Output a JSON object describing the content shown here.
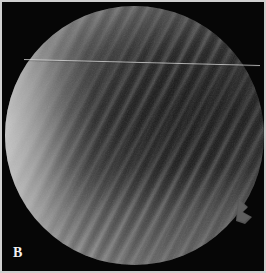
{
  "figure": {
    "panel_label": "B",
    "caption_alt": "Circular specimen micrograph with diagonal interference fringes",
    "background_color": "#060606",
    "frame_color": "#cfcfcf",
    "label_color": "#f2f2f2"
  },
  "specimen": {
    "name": "circular-specimen-disc",
    "shape": "circle",
    "center_x": 132,
    "center_y": 133,
    "radius": 130,
    "bright_limb_side": "left",
    "bright_limb_color": "#dadada",
    "dark_region_color": "#3e3e3e",
    "mid_region_color": "#787878"
  },
  "fringes": {
    "name": "interference-fringe-pattern",
    "orientation_degrees": 118,
    "spacing_px": 13,
    "contrast": "high-center-right",
    "light_band_color": "#9a9a9a",
    "dark_band_color": "#3a3a3a"
  },
  "scratch": {
    "name": "horizontal-fiducial-line",
    "x1": 22,
    "y1": 57,
    "x2": 258,
    "y2": 63,
    "color": "#d6d6d6",
    "width_px": 1
  },
  "notch": {
    "name": "rim-notch-defect",
    "x": 240,
    "y": 208,
    "width": 14,
    "height": 14,
    "color": "#5a5a5a"
  }
}
